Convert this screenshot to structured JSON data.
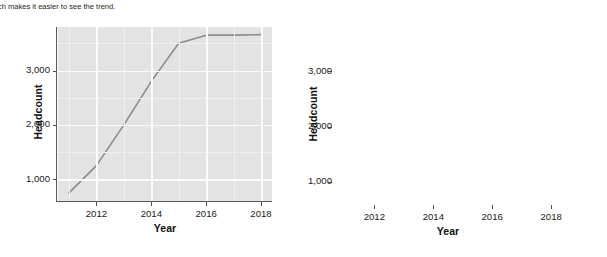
{
  "caption": {
    "text": "hich makes it easier to see the trend.",
    "text_right": ""
  },
  "figures": [
    {
      "id": "left",
      "name": "headcount-chart-gray-theme",
      "style": "gray-panel-with-gridlines",
      "panel_fill": "#e3e3e3",
      "grid_major_color": "#fbfbfb",
      "grid_minor_color": "#f0f0f0",
      "line_color": "#8c8c8c",
      "xlabel": "Year",
      "ylabel": "Headcount",
      "xticks": [
        "2012",
        "2014",
        "2016",
        "2018"
      ],
      "yticks": [
        "1,000",
        "2,000",
        "3,000"
      ]
    },
    {
      "id": "right",
      "name": "headcount-chart-minimal-theme",
      "style": "white-panel-no-gridlines",
      "panel_fill": "#ffffff",
      "line_color": "#8c8c8c",
      "xlabel": "Year",
      "ylabel": "Headcount",
      "xticks": [
        "2012",
        "2014",
        "2016",
        "2018"
      ],
      "yticks": [
        "1,000",
        "2,000",
        "3,000"
      ]
    }
  ],
  "chart_data": [
    {
      "type": "line",
      "id": "left",
      "title": "",
      "xlabel": "Year",
      "ylabel": "Headcount",
      "x": [
        2011,
        2012,
        2013,
        2014,
        2015,
        2016,
        2017,
        2018
      ],
      "values": [
        750,
        1250,
        2000,
        2800,
        3500,
        3650,
        3650,
        3660
      ],
      "xlim": [
        2010.6,
        2018.4
      ],
      "ylim": [
        600,
        3800
      ],
      "xticks": [
        2012,
        2014,
        2016,
        2018
      ],
      "yticks": [
        1000,
        2000,
        3000
      ],
      "ytick_labels": [
        "1,000",
        "2,000",
        "3,000"
      ],
      "grid": true,
      "legend": "none",
      "line_color": "#8c8c8c"
    },
    {
      "type": "line",
      "id": "right",
      "title": "",
      "xlabel": "Year",
      "ylabel": "Headcount",
      "x": [
        2011,
        2012,
        2013,
        2014,
        2015,
        2016,
        2017,
        2018
      ],
      "values": [
        750,
        1250,
        2000,
        2800,
        3500,
        3650,
        3650,
        3660
      ],
      "xlim": [
        2010.6,
        2018.4
      ],
      "ylim": [
        600,
        3800
      ],
      "xticks": [
        2012,
        2014,
        2016,
        2018
      ],
      "yticks": [
        1000,
        2000,
        3000
      ],
      "ytick_labels": [
        "1,000",
        "2,000",
        "3,000"
      ],
      "grid": false,
      "legend": "none",
      "line_color": "#8c8c8c"
    }
  ]
}
